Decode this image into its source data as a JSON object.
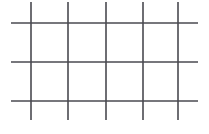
{
  "figure": {
    "title": "",
    "background_color": "#ffffff",
    "width": 209,
    "height": 134
  },
  "chart_data": {
    "type": "line",
    "title": "",
    "subtitle": "",
    "xlabel": "",
    "ylabel": "",
    "grid": true,
    "legend": null,
    "stroke_color": "#4a4a50",
    "stroke_width": 1.6,
    "xlim": [
      0,
      209
    ],
    "ylim": [
      0,
      134
    ],
    "vertical_lines": [
      {
        "label": "v1",
        "x": 31,
        "y_start": 2,
        "y_end": 120
      },
      {
        "label": "v2",
        "x": 68,
        "y_start": 2,
        "y_end": 120
      },
      {
        "label": "v3",
        "x": 106,
        "y_start": 2,
        "y_end": 120
      },
      {
        "label": "v4",
        "x": 143,
        "y_start": 2,
        "y_end": 120
      },
      {
        "label": "v5",
        "x": 178,
        "y_start": 2,
        "y_end": 120
      }
    ],
    "horizontal_lines": [
      {
        "label": "h1",
        "y": 23,
        "x_start": 11,
        "x_end": 198
      },
      {
        "label": "h2",
        "y": 62,
        "x_start": 11,
        "x_end": 198
      },
      {
        "label": "h3",
        "y": 101,
        "x_start": 11,
        "x_end": 198
      }
    ],
    "counts": {
      "vertical": 5,
      "horizontal": 3,
      "columns": 4,
      "rows": 2,
      "cells": 8,
      "intersections": 15
    },
    "spacing": {
      "vertical_gaps": [
        37,
        38,
        37,
        35
      ],
      "horizontal_gaps": [
        39,
        39
      ]
    }
  }
}
